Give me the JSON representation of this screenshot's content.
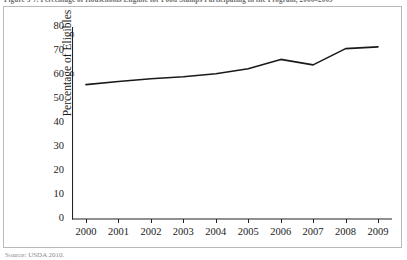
{
  "figure": {
    "caption": "Figure 3-7.   Percentage of Households Eligible for Food Stamps Participating in the Program, 2000–2009",
    "source_note": "Source: USDA 2010."
  },
  "chart_data": {
    "type": "line",
    "title": "",
    "xlabel": "",
    "ylabel": "Percentage of Eligibles",
    "categories": [
      "2000",
      "2001",
      "2002",
      "2003",
      "2004",
      "2005",
      "2006",
      "2007",
      "2008",
      "2009"
    ],
    "x": [
      2000,
      2001,
      2002,
      2003,
      2004,
      2005,
      2006,
      2007,
      2008,
      2009
    ],
    "values": [
      56,
      57.3,
      58.4,
      59.3,
      60.5,
      62.6,
      66.5,
      64.2,
      71,
      71.7
    ],
    "series": [
      {
        "name": "Percentage of Eligibles",
        "values": [
          56,
          57.3,
          58.4,
          59.3,
          60.5,
          62.6,
          66.5,
          64.2,
          71,
          71.7
        ],
        "color": "#1a1a1a"
      }
    ],
    "ylim": [
      0,
      80
    ],
    "yticks": [
      0,
      10,
      20,
      30,
      40,
      50,
      60,
      70,
      80
    ],
    "ytick_labels": [
      "0",
      "10",
      "20",
      "30",
      "40",
      "50",
      "60",
      "70",
      "80"
    ],
    "xtick_labels": [
      "2000",
      "2001",
      "2002",
      "2003",
      "2004",
      "2005",
      "2006",
      "2007",
      "2008",
      "2009"
    ],
    "grid": false,
    "legend": "none",
    "line_color": "#1a1a1a",
    "axis_color": "#222222"
  }
}
